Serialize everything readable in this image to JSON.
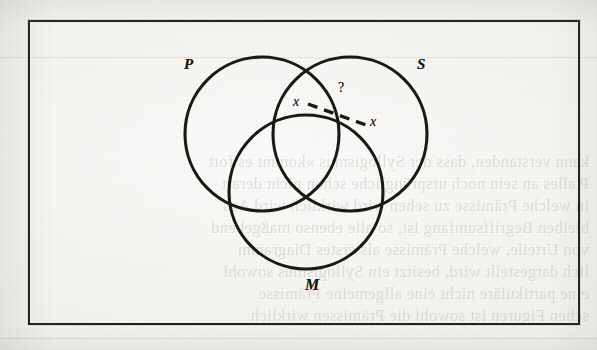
{
  "page": {
    "kind": "scanned-book-page",
    "background_color": "#f4f3f0",
    "ink_color": "#1a1916"
  },
  "figure": {
    "type": "venn-diagram",
    "subtype": "three-circle-syllogism",
    "frame": {
      "border_color": "#22211f",
      "border_width_px": 2
    },
    "circles": [
      {
        "id": "P",
        "label": "P",
        "cx": 262,
        "cy": 134,
        "r": 77,
        "label_x": 184,
        "label_y": 56
      },
      {
        "id": "S",
        "label": "S",
        "cx": 350,
        "cy": 134,
        "r": 77,
        "label_x": 417,
        "label_y": 56
      },
      {
        "id": "M",
        "label": "M",
        "cx": 306,
        "cy": 192,
        "r": 77,
        "label_x": 305,
        "label_y": 276
      }
    ],
    "annotations": [
      {
        "id": "x-left",
        "text": "x",
        "x": 293,
        "y": 94,
        "style": "italic"
      },
      {
        "id": "x-right",
        "text": "x",
        "x": 370,
        "y": 114,
        "style": "italic"
      },
      {
        "id": "question-mark",
        "text": "?",
        "x": 338,
        "y": 80,
        "style": "roman"
      }
    ],
    "connector": {
      "id": "dashed-bar",
      "type": "dashed-line",
      "from": {
        "x": 308,
        "y": 104
      },
      "to": {
        "x": 366,
        "y": 125
      },
      "dash_px": 9,
      "gap_px": 6,
      "width_px": 3,
      "color": "#1a1916"
    }
  },
  "ghost_text": {
    "note": "faint mirrored bleed-through from the reverse side of the page",
    "lines": [
      {
        "text": "kann verstanden, dass der Syllogismus »kommt es fort",
        "x": 8,
        "y": 160
      },
      {
        "text": "P alles an sein noch ursprüngliche schon nicht derart",
        "x": 8,
        "y": 182
      },
      {
        "text": "in welche Prämisse zu sehen wird wirklich wird Aus",
        "x": 8,
        "y": 204
      },
      {
        "text": "bleiben Begriffsumfang ist, so alle ebenso maßgebend",
        "x": 8,
        "y": 226
      },
      {
        "text": "von Urteile, welche Prämisse als erstes Diagramm",
        "x": 8,
        "y": 248
      },
      {
        "text": "lich dargestellt wird, besitzt ein Syllogismus sowohl",
        "x": 8,
        "y": 270
      },
      {
        "text": "eine partikuläre nicht eine allgemeine Prämisse",
        "x": 8,
        "y": 292
      },
      {
        "text": "schen Figuren ist sowohl die Prämissen wirklich",
        "x": 8,
        "y": 314
      }
    ]
  },
  "rules": [
    {
      "y": 57,
      "x": 0,
      "w": 597
    },
    {
      "y": 338,
      "x": 0,
      "w": 597
    }
  ]
}
